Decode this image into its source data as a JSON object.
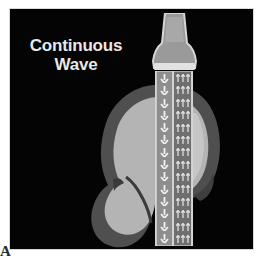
{
  "figure": {
    "label": "A",
    "caption_line1": "Continuous",
    "caption_line2": "Wave",
    "panel_background": "#040404",
    "text_color": "#e8e8e8"
  },
  "illustration": {
    "type": "ultrasound-beam-diagram",
    "mode": "Continuous Wave",
    "transducer": {
      "name": "transducer-probe",
      "body_color": "#9a9a9a",
      "outline_color": "#d6d6d6",
      "footplate_color": "#e2e2e2"
    },
    "beam": {
      "name": "ultrasound-beam-column",
      "transmit_lane": {
        "direction": "down",
        "arrow_count": 14,
        "arrow_color": "#f2f2f2",
        "lane_color": "#8e8e8e"
      },
      "receive_lane": {
        "direction": "up",
        "row_count": 14,
        "arrows_per_row": 3,
        "arrow_color": "#f2f2f2",
        "lane_color": "#6f6f6f"
      }
    },
    "anatomy": {
      "name": "organ-cross-section",
      "outer_rim_color": "#4f4f4f",
      "inner_tissue_color": "#b4b4b4",
      "lower_lobe_color": "#b4b4b4",
      "hilum_color": "#3a3a3a"
    }
  },
  "colors": {
    "page_background": "#ffffff",
    "panel": "#040404",
    "dark_gray": "#4f4f4f",
    "light_gray": "#b4b4b4",
    "white_arrow": "#f2f2f2"
  }
}
